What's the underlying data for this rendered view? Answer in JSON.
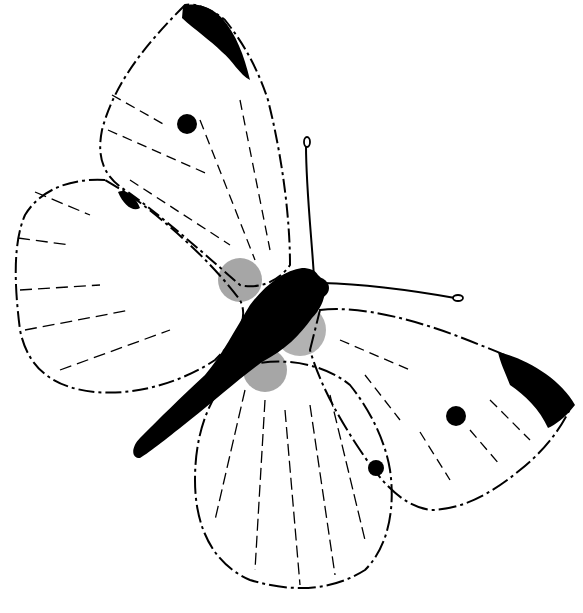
{
  "image": {
    "subject": "Cabbage white butterfly",
    "style": "black-and-white pen and ink line illustration",
    "background_color": "#ffffff",
    "ink_color": "#000000"
  }
}
